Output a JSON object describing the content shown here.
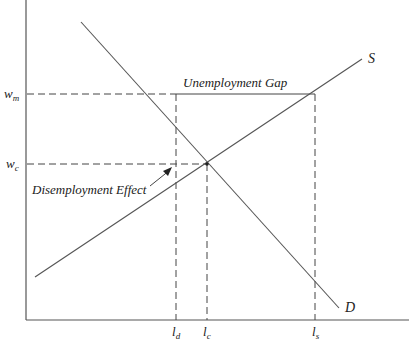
{
  "diagram": {
    "curves": {
      "supply_label": "S",
      "demand_label": "D"
    },
    "y_axis": {
      "ticks": [
        {
          "id": "wm",
          "base": "w",
          "sub": "m"
        },
        {
          "id": "wc",
          "base": "w",
          "sub": "c"
        }
      ]
    },
    "x_axis": {
      "ticks": [
        {
          "id": "ld",
          "base": "l",
          "sub": "d"
        },
        {
          "id": "lc",
          "base": "l",
          "sub": "c"
        },
        {
          "id": "ls",
          "base": "l",
          "sub": "s"
        }
      ]
    },
    "annotations": {
      "unemployment_gap": "Unemployment Gap",
      "disemployment_effect": "Disemployment Effect"
    },
    "colors": {
      "line": "#555555",
      "text": "#222222",
      "background": "#ffffff"
    }
  }
}
